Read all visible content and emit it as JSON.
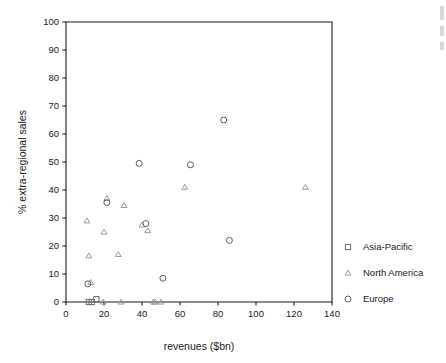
{
  "chart_data": {
    "type": "scatter",
    "title": "",
    "xlabel": "revenues ($bn)",
    "ylabel": "% extra-regional sales",
    "xlim": [
      0,
      140
    ],
    "ylim": [
      0,
      100
    ],
    "xticks": [
      0,
      20,
      40,
      60,
      80,
      100,
      120,
      140
    ],
    "yticks": [
      0,
      10,
      20,
      30,
      40,
      50,
      60,
      70,
      80,
      90,
      100
    ],
    "grid": false,
    "legend_position": "right",
    "series": [
      {
        "name": "Asia-Pacific",
        "marker": "square",
        "color": "#6b6b6b",
        "points": [
          {
            "x": 12,
            "y": 0
          },
          {
            "x": 13.5,
            "y": 0
          },
          {
            "x": 16,
            "y": 1
          }
        ]
      },
      {
        "name": "North America",
        "marker": "triangle",
        "color": "#9a9a9a",
        "points": [
          {
            "x": 11,
            "y": 29
          },
          {
            "x": 12,
            "y": 16.5
          },
          {
            "x": 13,
            "y": 7
          },
          {
            "x": 19.5,
            "y": 0
          },
          {
            "x": 20,
            "y": 25
          },
          {
            "x": 21.5,
            "y": 37
          },
          {
            "x": 27.5,
            "y": 17
          },
          {
            "x": 29,
            "y": 0
          },
          {
            "x": 30.5,
            "y": 34.5
          },
          {
            "x": 40,
            "y": 27.5
          },
          {
            "x": 43,
            "y": 25.5
          },
          {
            "x": 46,
            "y": 0
          },
          {
            "x": 47,
            "y": 0
          },
          {
            "x": 50,
            "y": 0
          },
          {
            "x": 62.5,
            "y": 41
          },
          {
            "x": 126,
            "y": 41
          }
        ]
      },
      {
        "name": "Europe",
        "marker": "circle",
        "color": "#5d5d5d",
        "points": [
          {
            "x": 11.5,
            "y": 6.5
          },
          {
            "x": 21.5,
            "y": 35.5
          },
          {
            "x": 38.5,
            "y": 49.5
          },
          {
            "x": 42,
            "y": 28
          },
          {
            "x": 51,
            "y": 8.5
          },
          {
            "x": 65.5,
            "y": 49
          },
          {
            "x": 83,
            "y": 65
          },
          {
            "x": 86,
            "y": 22
          }
        ]
      }
    ],
    "legend": [
      {
        "label": "Asia-Pacific",
        "marker": "square"
      },
      {
        "label": "North America",
        "marker": "triangle"
      },
      {
        "label": "Europe",
        "marker": "circle"
      }
    ]
  }
}
